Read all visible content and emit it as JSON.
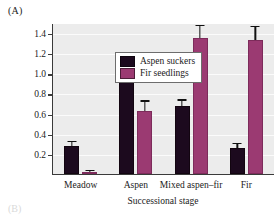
{
  "panel": {
    "label": "(A)",
    "next_label": "(B)"
  },
  "legend": {
    "position": "top-left-inside",
    "entries": [
      {
        "label": "Aspen suckers",
        "color": "#1c0a1e",
        "swatch_name": "legend-swatch-aspen-suckers"
      },
      {
        "label": "Fir seedlings",
        "color": "#9b3a72",
        "swatch_name": "legend-swatch-fir-seedlings"
      }
    ]
  },
  "chart_data": {
    "type": "bar",
    "title": "",
    "subtitle": "",
    "xlabel": "Successional stage",
    "ylabel": "Density (no./m²)",
    "categories": [
      "Meadow",
      "Aspen",
      "Mixed aspen–fir",
      "Fir"
    ],
    "series": [
      {
        "name": "Aspen suckers",
        "color": "#1c0a1e",
        "values": [
          0.28,
          1.05,
          0.68,
          0.26
        ],
        "errors": [
          0.04,
          0.07,
          0.05,
          0.04
        ]
      },
      {
        "name": "Fir seedlings",
        "color": "#9b3a72",
        "values": [
          0.02,
          0.63,
          1.35,
          1.33
        ],
        "errors": [
          0.01,
          0.09,
          0.12,
          0.13
        ]
      }
    ],
    "ylim": [
      0.0,
      1.5
    ],
    "yticks": [
      0.2,
      0.4,
      0.6,
      0.8,
      1.0,
      1.2,
      1.4
    ],
    "ytick_labels": [
      "0.2",
      "0.4",
      "0.6",
      "0.8",
      "1.0",
      "1.2",
      "1.4"
    ],
    "grid": true,
    "grid_axis": "y",
    "legend_position": "upper left",
    "plot_background": "#ececec",
    "axis_color": "#3a3a3a"
  }
}
